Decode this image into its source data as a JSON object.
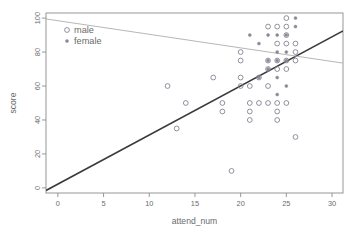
{
  "chart_data": {
    "type": "scatter",
    "title": "",
    "xlabel": "attend_num",
    "ylabel": "score",
    "xlim": [
      -1.3,
      31.2
    ],
    "ylim": [
      -3,
      103
    ],
    "grid": false,
    "legend_position": "top-left",
    "x_ticks": [
      0,
      5,
      10,
      15,
      20,
      25,
      30
    ],
    "y_ticks": [
      0,
      20,
      40,
      60,
      80,
      100
    ],
    "x_tick_labels": [
      "0",
      "5",
      "10",
      "15",
      "20",
      "25",
      "30"
    ],
    "y_tick_labels": [
      "0",
      "20",
      "40",
      "60",
      "80",
      "100"
    ],
    "legend": [
      {
        "label": "male",
        "marker": "open-circle",
        "color": "#7d7d8c"
      },
      {
        "label": "female",
        "marker": "filled-dot",
        "color": "#8a8a96"
      }
    ],
    "series": [
      {
        "name": "male",
        "marker": "open-circle",
        "color": "#7d7d8c",
        "points": [
          [
            12,
            60
          ],
          [
            13,
            35
          ],
          [
            14,
            50
          ],
          [
            17,
            65
          ],
          [
            18,
            50
          ],
          [
            18,
            45
          ],
          [
            20,
            80
          ],
          [
            20,
            75
          ],
          [
            20,
            65
          ],
          [
            20,
            60
          ],
          [
            19,
            10
          ],
          [
            21,
            60
          ],
          [
            21,
            50
          ],
          [
            21,
            45
          ],
          [
            21,
            40
          ],
          [
            22,
            50
          ],
          [
            22,
            65
          ],
          [
            23,
            75
          ],
          [
            23,
            70
          ],
          [
            23,
            60
          ],
          [
            23,
            50
          ],
          [
            24,
            75
          ],
          [
            24,
            70
          ],
          [
            24,
            50
          ],
          [
            24,
            45
          ],
          [
            24,
            40
          ],
          [
            25,
            100
          ],
          [
            25,
            95
          ],
          [
            25,
            90
          ],
          [
            25,
            85
          ],
          [
            25,
            75
          ],
          [
            25,
            70
          ],
          [
            25,
            50
          ],
          [
            26,
            85
          ],
          [
            26,
            80
          ],
          [
            26,
            75
          ],
          [
            26,
            30
          ],
          [
            23,
            95
          ],
          [
            24,
            85
          ],
          [
            24,
            95
          ]
        ]
      },
      {
        "name": "female",
        "marker": "filled-dot",
        "color": "#8a8a96",
        "points": [
          [
            21,
            90
          ],
          [
            22,
            85
          ],
          [
            23,
            90
          ],
          [
            24,
            90
          ],
          [
            25,
            90
          ],
          [
            23,
            75
          ],
          [
            24,
            75
          ],
          [
            25,
            80
          ],
          [
            23,
            70
          ],
          [
            24,
            65
          ],
          [
            24,
            55
          ],
          [
            26,
            100
          ],
          [
            26,
            95
          ],
          [
            25,
            60
          ],
          [
            22,
            65
          ],
          [
            25,
            75
          ],
          [
            24,
            80
          ]
        ]
      }
    ],
    "fit_lines": [
      {
        "name": "male-fit",
        "color": "#3a3a3a",
        "width": 1.55,
        "x1": -1.3,
        "y1": -1.5,
        "x2": 31.2,
        "y2": 92.5
      },
      {
        "name": "female-fit",
        "color": "#b2b2b2",
        "width": 0.95,
        "x1": -1.3,
        "y1": 99.5,
        "x2": 31.2,
        "y2": 73.5
      }
    ]
  }
}
